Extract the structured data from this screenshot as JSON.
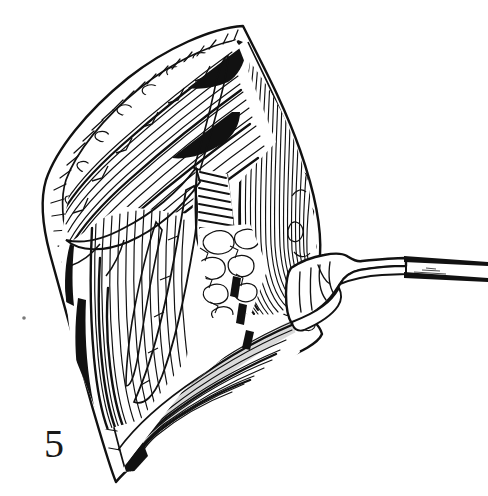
{
  "figure": {
    "label": "5",
    "caption_text": "",
    "background_color": "#ffffff",
    "ink_color": "#111111",
    "width": 488,
    "height": 496,
    "medium": "pen-and-ink line drawing"
  },
  "scene": {
    "title": "",
    "wound": {
      "name": "surgical-incision-opening",
      "shape": "elongated lens / leaf-shaped opening",
      "apex_top": "top vertex of the incision",
      "apex_bottom": "bottom vertex of the incision"
    },
    "structures": [
      {
        "id": "skin-edge-left",
        "label": "left retracted skin and subcutaneous margin",
        "rendering": "outlined band with stipple and short cross-hatch"
      },
      {
        "id": "skin-edge-right",
        "label": "right retracted skin and subcutaneous margin",
        "rendering": "outlined band with nodular fat lobules"
      },
      {
        "id": "oblique-muscle-upper-left",
        "label": "oblique muscle fibers running upper-left to lower-right",
        "rendering": "long parallel diagonal hatch lines"
      },
      {
        "id": "vertical-muscle-right",
        "label": "vertical striated muscle belly at right of field",
        "rendering": "dense near-vertical curved fiber strokes"
      },
      {
        "id": "tendinous-band",
        "label": "tendinous / aponeurotic band with ladder hatching",
        "rendering": "tight transverse ladder hatch strip"
      },
      {
        "id": "fat-areolar-tissue",
        "label": "lobulated fat and areolar tissue in depth of wound",
        "rendering": "rounded outlined lobules, mostly white"
      },
      {
        "id": "neurovascular-bundle",
        "label": "branching neurovascular bundle crossing the field",
        "rendering": "paired outline cords that branch"
      },
      {
        "id": "lower-muscle-flap",
        "label": "lower muscle flap under the dashed incision line",
        "rendering": "fanned oblique fiber strokes with deep shadow"
      }
    ],
    "markings": {
      "dashed_incision": {
        "label": "planned incision line",
        "style": "dashed",
        "dash_count": 3
      }
    },
    "instrument": {
      "name": "surgical-retractor",
      "label": "hand-held retractor blade with shaft",
      "entering_from": "right edge of the image",
      "parts": [
        "blade",
        "neck",
        "shaft"
      ]
    },
    "artifacts": [
      {
        "id": "scan-speck",
        "label": "small scan speck",
        "x": 24,
        "y": 318
      }
    ]
  }
}
